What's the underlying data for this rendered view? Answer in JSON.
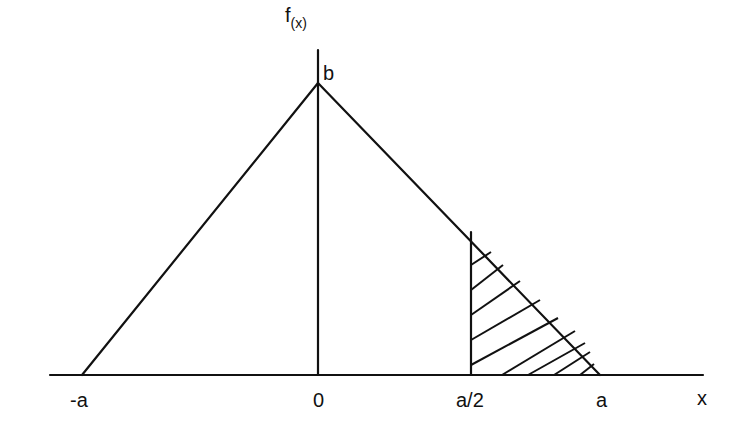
{
  "diagram": {
    "type": "triangular-distribution",
    "y_axis_label": "f",
    "y_axis_label_sub": "(x)",
    "peak_label": "b",
    "x_axis_label": "x",
    "x_ticks": [
      "-a",
      "0",
      "a/2",
      "a"
    ],
    "shaded_region": "from a/2 to a under f(x)",
    "colors": {
      "line": "#111111",
      "background": "#ffffff"
    }
  }
}
